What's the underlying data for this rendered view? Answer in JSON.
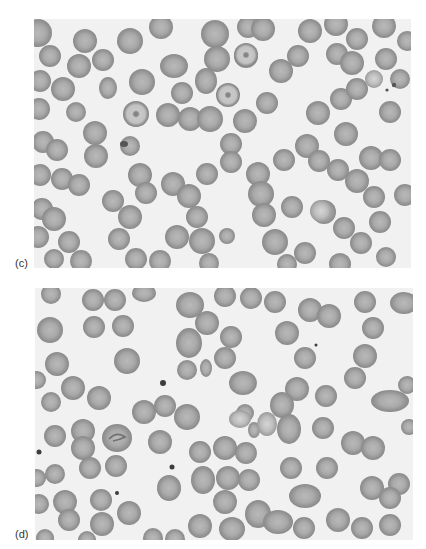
{
  "figure": {
    "panels": [
      {
        "label": "(c)",
        "description": "Light micrograph of a peripheral blood smear showing numerous red blood cells, including target cells with central dark spots and some overlapping / stacked cells",
        "background_color": "#f1f1f1",
        "cell_color": "#a8a8a8"
      },
      {
        "label": "(d)",
        "description": "Light micrograph of a peripheral blood smear showing red blood cells of variable shape including ovalocytes, a few fragmented cells, a folded cell, and scattered small dark inclusions/platelets",
        "background_color": "#f1f1f1",
        "cell_color": "#a4a4a4"
      }
    ]
  }
}
